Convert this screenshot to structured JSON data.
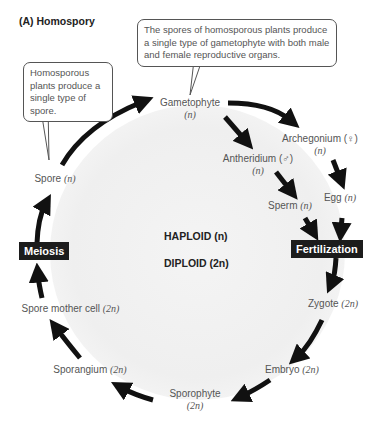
{
  "title": "(A)  Homospory",
  "callouts": {
    "spore": "Homosporous plants produce a single type of spore.",
    "gametophyte": "The spores of homosporous plants produce a single type of gametophyte with both male and female reproductive organs."
  },
  "stages": {
    "gametophyte": {
      "name": "Gametophyte",
      "ploidy": "(n)"
    },
    "archegonium": {
      "name": "Archegonium (♀)",
      "ploidy": "(n)"
    },
    "antheridium": {
      "name": "Antheridium (♂)",
      "ploidy": "(n)"
    },
    "egg": {
      "name": "Egg ",
      "ploidy": "(n)"
    },
    "sperm": {
      "name": "Sperm ",
      "ploidy": "(n)"
    },
    "zygote": {
      "name": "Zygote ",
      "ploidy": "(2n)"
    },
    "embryo": {
      "name": "Embryo ",
      "ploidy": "(2n)"
    },
    "sporophyte": {
      "name": "Sporophyte",
      "ploidy": "(2n)"
    },
    "sporangium": {
      "name": "Sporangium ",
      "ploidy": "(2n)"
    },
    "spore_mother_cell": {
      "name": "Spore mother cell ",
      "ploidy": "(2n)"
    },
    "spore": {
      "name": "Spore ",
      "ploidy": "(n)"
    }
  },
  "events": {
    "meiosis": "Meiosis",
    "fertilization": "Fertilization"
  },
  "phases": {
    "haploid": "HAPLOID (n)",
    "diploid": "DIPLOID (2n)"
  },
  "colors": {
    "arrow": "#111111",
    "event_box": "#1c1c1c",
    "backdrop": "#efefef"
  }
}
